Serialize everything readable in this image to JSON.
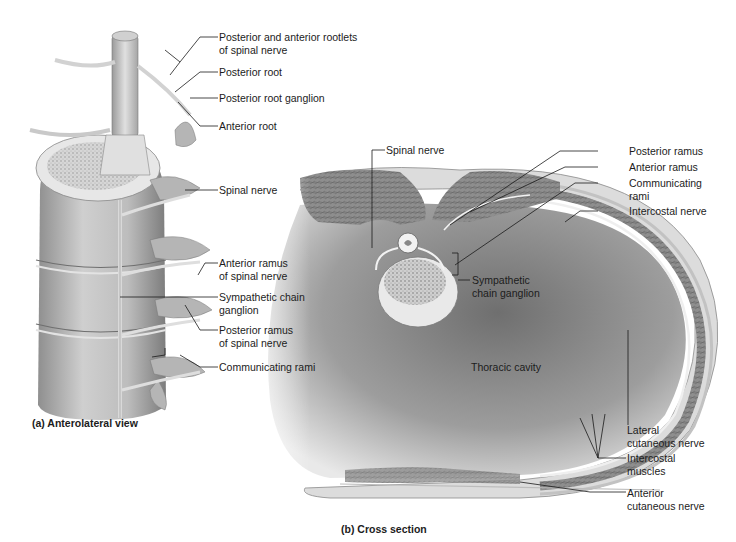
{
  "figure": {
    "panel_a": {
      "caption": "(a) Anterolateral view",
      "labels": [
        {
          "id": "posterior-anterior-rootlets",
          "line1": "Posterior and anterior rootlets",
          "line2": "of spinal nerve"
        },
        {
          "id": "posterior-root",
          "line1": "Posterior root",
          "line2": ""
        },
        {
          "id": "posterior-root-ganglion",
          "line1": "Posterior root ganglion",
          "line2": ""
        },
        {
          "id": "anterior-root",
          "line1": "Anterior root",
          "line2": ""
        },
        {
          "id": "spinal-nerve",
          "line1": "Spinal nerve",
          "line2": ""
        },
        {
          "id": "anterior-ramus",
          "line1": "Anterior ramus",
          "line2": "of spinal nerve"
        },
        {
          "id": "sympathetic-chain-ganglion",
          "line1": "Sympathetic chain",
          "line2": "ganglion"
        },
        {
          "id": "posterior-ramus",
          "line1": "Posterior ramus",
          "line2": "of spinal nerve"
        },
        {
          "id": "communicating-rami",
          "line1": "Communicating rami",
          "line2": ""
        }
      ]
    },
    "panel_b": {
      "caption": "(b) Cross section",
      "labels": [
        {
          "id": "spinal-nerve",
          "line1": "Spinal nerve",
          "line2": ""
        },
        {
          "id": "posterior-ramus",
          "line1": "Posterior ramus",
          "line2": ""
        },
        {
          "id": "anterior-ramus",
          "line1": "Anterior ramus",
          "line2": ""
        },
        {
          "id": "communicating-rami",
          "line1": "Communicating",
          "line2": "rami"
        },
        {
          "id": "intercostal-nerve",
          "line1": "Intercostal nerve",
          "line2": ""
        },
        {
          "id": "sympathetic-chain-ganglion",
          "line1": "Sympathetic",
          "line2": "chain ganglion"
        },
        {
          "id": "thoracic-cavity",
          "line1": "Thoracic cavity",
          "line2": ""
        },
        {
          "id": "lateral-cutaneous-nerve",
          "line1": "Lateral",
          "line2": "cutaneous nerve"
        },
        {
          "id": "intercostal-muscles",
          "line1": "Intercostal",
          "line2": "muscles"
        },
        {
          "id": "anterior-cutaneous-nerve",
          "line1": "Anterior",
          "line2": "cutaneous nerve"
        }
      ]
    },
    "colors": {
      "background": "#ffffff",
      "leader_line": "#1a1a1a",
      "bone": "#d9d9d9",
      "nerve": "#e6e6e6",
      "muscle": "#9a9a9a",
      "cavity": "#8c8c8c"
    }
  }
}
